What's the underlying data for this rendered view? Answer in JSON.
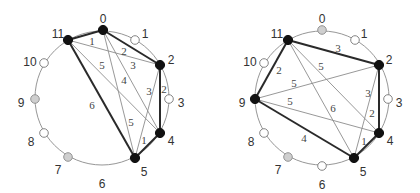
{
  "diagrams": [
    {
      "name": "left-graph",
      "center": [
        102,
        98
      ],
      "radius": 67,
      "nodes": [
        {
          "id": "0",
          "x": 103,
          "y": 30,
          "style": "black",
          "lx": 103,
          "ly": 19
        },
        {
          "id": "1",
          "x": 135,
          "y": 40,
          "style": "white",
          "lx": 145,
          "ly": 34
        },
        {
          "id": "2",
          "x": 160,
          "y": 65,
          "style": "black",
          "lx": 171,
          "ly": 60
        },
        {
          "id": "3",
          "x": 169,
          "y": 99,
          "style": "white",
          "lx": 181,
          "ly": 103
        },
        {
          "id": "4",
          "x": 160,
          "y": 133,
          "style": "black",
          "lx": 171,
          "ly": 141
        },
        {
          "id": "5",
          "x": 135,
          "y": 158,
          "style": "black",
          "lx": 144,
          "ly": 172
        },
        {
          "id": "6",
          "x": 102,
          "y": 165,
          "style": "none",
          "lx": 102,
          "ly": 184
        },
        {
          "id": "7",
          "x": 68,
          "y": 157,
          "style": "gray",
          "lx": 58,
          "ly": 170
        },
        {
          "id": "8",
          "x": 44,
          "y": 133,
          "style": "white",
          "lx": 31,
          "ly": 142
        },
        {
          "id": "9",
          "x": 35,
          "y": 99,
          "style": "gray",
          "lx": 21,
          "ly": 103
        },
        {
          "id": "10",
          "x": 44,
          "y": 63,
          "style": "white",
          "lx": 30,
          "ly": 62
        },
        {
          "id": "11",
          "x": 68,
          "y": 40,
          "style": "black",
          "lx": 58,
          "ly": 34
        }
      ],
      "edges": [
        {
          "from": "11",
          "to": "0",
          "weight": "1",
          "thick": true,
          "lx": 92,
          "ly": 45
        },
        {
          "from": "0",
          "to": "2",
          "weight": "2",
          "thick": true,
          "lx": 124,
          "ly": 55
        },
        {
          "from": "11",
          "to": "2",
          "weight": "3",
          "thick": false,
          "lx": 133,
          "ly": 69
        },
        {
          "from": "2",
          "to": "4",
          "weight": "2",
          "thick": true,
          "lx": 164,
          "ly": 93
        },
        {
          "from": "4",
          "to": "5",
          "weight": "1",
          "thick": true,
          "lx": 144,
          "ly": 144
        },
        {
          "from": "11",
          "to": "5",
          "weight": "6",
          "thick": true,
          "lx": 92,
          "ly": 109
        },
        {
          "from": "11",
          "to": "4",
          "weight": "5",
          "thick": false,
          "lx": 102,
          "ly": 69
        },
        {
          "from": "0",
          "to": "4",
          "weight": "4",
          "thick": false,
          "lx": 124,
          "ly": 84
        },
        {
          "from": "0",
          "to": "5",
          "weight": "5",
          "thick": false,
          "lx": 131,
          "ly": 126
        },
        {
          "from": "2",
          "to": "5",
          "weight": "3",
          "thick": false,
          "lx": 149,
          "ly": 95
        }
      ]
    },
    {
      "name": "right-graph",
      "center": [
        322,
        98
      ],
      "radius": 67,
      "nodes": [
        {
          "id": "0",
          "x": 322,
          "y": 30,
          "style": "gray",
          "lx": 322,
          "ly": 19
        },
        {
          "id": "1",
          "x": 355,
          "y": 40,
          "style": "white",
          "lx": 364,
          "ly": 34
        },
        {
          "id": "2",
          "x": 379,
          "y": 65,
          "style": "black",
          "lx": 389,
          "ly": 60
        },
        {
          "id": "3",
          "x": 388,
          "y": 99,
          "style": "white",
          "lx": 399,
          "ly": 103
        },
        {
          "id": "4",
          "x": 379,
          "y": 133,
          "style": "black",
          "lx": 390,
          "ly": 141
        },
        {
          "id": "5",
          "x": 354,
          "y": 158,
          "style": "black",
          "lx": 363,
          "ly": 172
        },
        {
          "id": "6",
          "x": 322,
          "y": 166,
          "style": "white",
          "lx": 322,
          "ly": 185
        },
        {
          "id": "7",
          "x": 288,
          "y": 157,
          "style": "gray",
          "lx": 278,
          "ly": 170
        },
        {
          "id": "8",
          "x": 264,
          "y": 133,
          "style": "white",
          "lx": 251,
          "ly": 142
        },
        {
          "id": "9",
          "x": 255,
          "y": 99,
          "style": "black",
          "lx": 242,
          "ly": 103
        },
        {
          "id": "10",
          "x": 264,
          "y": 63,
          "style": "white",
          "lx": 250,
          "ly": 62
        },
        {
          "id": "11",
          "x": 288,
          "y": 40,
          "style": "black",
          "lx": 277,
          "ly": 34
        }
      ],
      "edges": [
        {
          "from": "11",
          "to": "2",
          "weight": "3",
          "thick": true,
          "lx": 338,
          "ly": 52
        },
        {
          "from": "2",
          "to": "4",
          "weight": "2",
          "thick": true,
          "lx": 372,
          "ly": 117
        },
        {
          "from": "4",
          "to": "5",
          "weight": "1",
          "thick": true,
          "lx": 364,
          "ly": 145
        },
        {
          "from": "5",
          "to": "9",
          "weight": "4",
          "thick": true,
          "lx": 304,
          "ly": 142
        },
        {
          "from": "9",
          "to": "11",
          "weight": "2",
          "thick": true,
          "lx": 279,
          "ly": 74
        },
        {
          "from": "9",
          "to": "2",
          "weight": "5",
          "thick": false,
          "lx": 294,
          "ly": 87
        },
        {
          "from": "9",
          "to": "4",
          "weight": "5",
          "thick": false,
          "lx": 290,
          "ly": 105
        },
        {
          "from": "11",
          "to": "4",
          "weight": "5",
          "thick": false,
          "lx": 321,
          "ly": 70
        },
        {
          "from": "11",
          "to": "5",
          "weight": "6",
          "thick": false,
          "lx": 333,
          "ly": 112
        },
        {
          "from": "2",
          "to": "5",
          "weight": "3",
          "thick": false,
          "lx": 368,
          "ly": 97
        }
      ]
    }
  ]
}
